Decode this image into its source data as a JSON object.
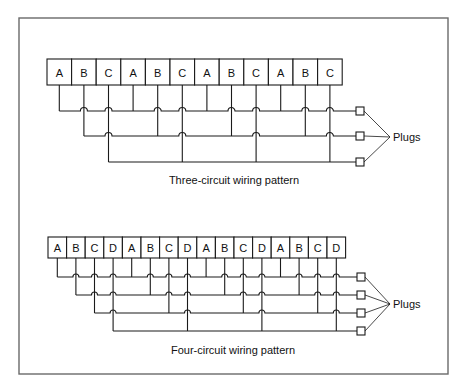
{
  "figure": {
    "frame": {
      "x": 19,
      "y": 18,
      "width": 429,
      "height": 356,
      "color": "#6a6a6a"
    },
    "diagrams": [
      {
        "id": "three-circuit",
        "caption": "Three-circuit wiring pattern",
        "caption_pos": {
          "x": 234,
          "y": 184
        },
        "plugs_label": "Plugs",
        "circuits": [
          "A",
          "B",
          "C"
        ],
        "boxes": [
          "A",
          "B",
          "C",
          "A",
          "B",
          "C",
          "A",
          "B",
          "C",
          "A",
          "B",
          "C"
        ],
        "box_x": 47,
        "box_y": 59,
        "box_w": 24.6,
        "box_h": 26,
        "row_y": [
          111,
          136,
          162
        ],
        "plug_x": 356,
        "plug_size": 8,
        "converge": {
          "x": 390,
          "y": 137
        },
        "hop_r": 3.5
      },
      {
        "id": "four-circuit",
        "caption": "Four-circuit wiring pattern",
        "caption_pos": {
          "x": 233,
          "y": 354
        },
        "plugs_label": "Plugs",
        "circuits": [
          "A",
          "B",
          "C",
          "D"
        ],
        "boxes": [
          "A",
          "B",
          "C",
          "D",
          "A",
          "B",
          "C",
          "D",
          "A",
          "B",
          "C",
          "D",
          "A",
          "B",
          "C",
          "D"
        ],
        "box_x": 48,
        "box_y": 237,
        "box_w": 18.6,
        "box_h": 21,
        "row_y": [
          277,
          295,
          313,
          331
        ],
        "plug_x": 357,
        "plug_size": 8,
        "converge": {
          "x": 390,
          "y": 304
        },
        "hop_r": 3
      }
    ]
  }
}
